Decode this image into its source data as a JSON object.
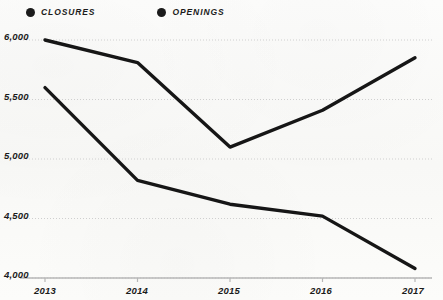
{
  "legend": {
    "items": [
      {
        "label": "CLOSURES",
        "color": "#1b1b1b",
        "marker": "circle-marker"
      },
      {
        "label": "OPENINGS",
        "color": "#1b1b1b",
        "marker": "circle-marker"
      }
    ]
  },
  "axes": {
    "y_ticks": [
      "6,000",
      "5,500",
      "5,000",
      "4,500",
      "4,000"
    ],
    "x_ticks": [
      "2013",
      "2014",
      "2015",
      "2016",
      "2017"
    ]
  },
  "colors": {
    "line": "#161616",
    "gridline": "#cfcfcf",
    "axis": "#b7b7b7",
    "text": "#1b1b1b",
    "background": "#fbfbf9"
  },
  "chart_data": {
    "type": "line",
    "title": "",
    "xlabel": "",
    "ylabel": "",
    "x": [
      "2013",
      "2014",
      "2015",
      "2016",
      "2017"
    ],
    "categories": [
      "2013",
      "2014",
      "2015",
      "2016",
      "2017"
    ],
    "series": [
      {
        "name": "OPENINGS",
        "color": "#161616",
        "values": [
          6000,
          5810,
          5100,
          5410,
          5850
        ]
      },
      {
        "name": "CLOSURES",
        "color": "#161616",
        "values": [
          5600,
          4820,
          4620,
          4520,
          4080
        ]
      }
    ],
    "ylim": [
      4000,
      6000
    ],
    "ytick_values": [
      6000,
      5500,
      5000,
      4500,
      4000
    ],
    "grid": true,
    "grid_style": "dotted-horizontal",
    "legend_position": "top-left"
  }
}
